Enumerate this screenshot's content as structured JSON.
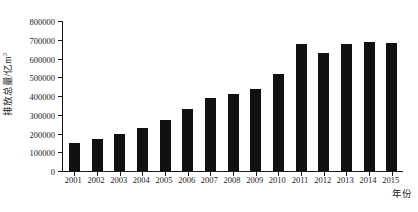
{
  "chart_data": {
    "type": "bar",
    "title": "",
    "subtitle": "",
    "xlabel": "年份",
    "ylabel_text": "排放总量/亿m",
    "ylabel_superscript": "3",
    "ylabel_full": "排放总量/亿m³",
    "categories": [
      "2001",
      "2002",
      "2003",
      "2004",
      "2005",
      "2006",
      "2007",
      "2008",
      "2009",
      "2010",
      "2011",
      "2012",
      "2013",
      "2014",
      "2015"
    ],
    "values": [
      150000,
      170000,
      200000,
      230000,
      270000,
      330000,
      390000,
      410000,
      440000,
      520000,
      680000,
      630000,
      680000,
      690000,
      685000
    ],
    "series": [
      {
        "name": "排放总量",
        "values": [
          150000,
          170000,
          200000,
          230000,
          270000,
          330000,
          390000,
          410000,
          440000,
          520000,
          680000,
          630000,
          680000,
          690000,
          685000
        ]
      }
    ],
    "ylim": [
      0,
      800000
    ],
    "ytick_values": [
      0,
      100000,
      200000,
      300000,
      400000,
      500000,
      600000,
      700000,
      800000
    ],
    "ytick_labels": [
      "0",
      "100000",
      "200000",
      "300000",
      "400000",
      "500000",
      "600000",
      "700000",
      "800000"
    ],
    "grid": false,
    "legend": null,
    "legend_position": "none",
    "bar_color": "#111111",
    "axis_color": "#1a1a1a",
    "background_color": "#ffffff"
  }
}
